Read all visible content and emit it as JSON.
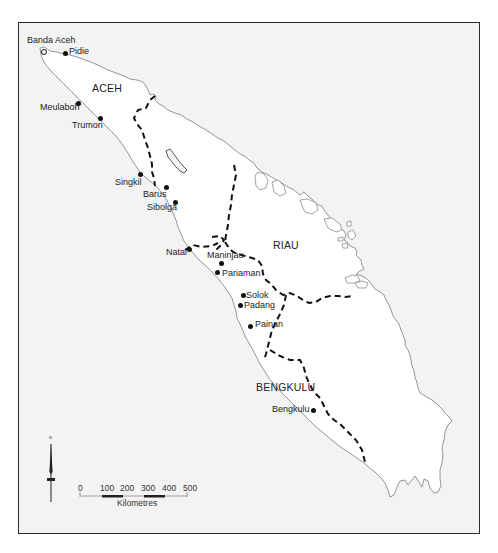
{
  "map": {
    "background_color": "#f3f3f3",
    "land_color": "#ffffff",
    "coastline_color": "#8a8a8a",
    "boundary_color": "#111111",
    "regions": [
      {
        "name": "ACEH"
      },
      {
        "name": "RIAU"
      },
      {
        "name": "BENGKULU"
      }
    ],
    "towns": [
      {
        "name": "Banda Aceh"
      },
      {
        "name": "Pidie"
      },
      {
        "name": "Meulaboh"
      },
      {
        "name": "Trumon"
      },
      {
        "name": "Singkil"
      },
      {
        "name": "Barus"
      },
      {
        "name": "Sibolga"
      },
      {
        "name": "Natal"
      },
      {
        "name": "Maninjau"
      },
      {
        "name": "Pariaman"
      },
      {
        "name": "Solok"
      },
      {
        "name": "Padang"
      },
      {
        "name": "Painan"
      },
      {
        "name": "Bengkulu"
      }
    ],
    "north_arrow": {
      "label": "N"
    },
    "scale_bar": {
      "ticks": [
        "0",
        "100",
        "200",
        "300",
        "400",
        "500"
      ],
      "unit_label": "Kilometres"
    }
  }
}
